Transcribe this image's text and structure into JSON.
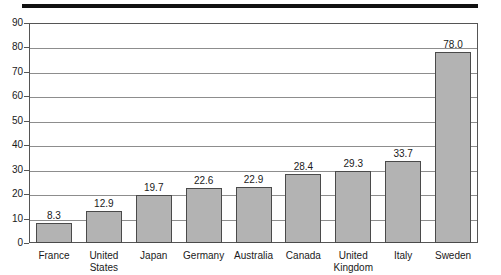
{
  "chart_data": {
    "type": "bar",
    "title": "",
    "subtitle": "",
    "xlabel": "",
    "ylabel": "",
    "ylim": [
      0,
      90
    ],
    "ytick_step": 10,
    "yticks": [
      90,
      80,
      70,
      60,
      50,
      40,
      30,
      20,
      10,
      0
    ],
    "grid": true,
    "legend": "none",
    "bar_color": "#b3b3b3",
    "bar_edge_color": "#4a4a4a",
    "categories": [
      "France",
      "United States",
      "Japan",
      "Germany",
      "Australia",
      "Canada",
      "United Kingdom",
      "Italy",
      "Sweden"
    ],
    "category_lines": [
      [
        "France"
      ],
      [
        "United",
        "States"
      ],
      [
        "Japan"
      ],
      [
        "Germany"
      ],
      [
        "Australia"
      ],
      [
        "Canada"
      ],
      [
        "United",
        "Kingdom"
      ],
      [
        "Italy"
      ],
      [
        "Sweden"
      ]
    ],
    "values": [
      8.3,
      12.9,
      19.7,
      22.6,
      22.9,
      28.4,
      29.3,
      33.7,
      78.0
    ],
    "data_labels": [
      "8.3",
      "12.9",
      "19.7",
      "22.6",
      "22.9",
      "28.4",
      "29.3",
      "33.7",
      "78.0"
    ]
  }
}
